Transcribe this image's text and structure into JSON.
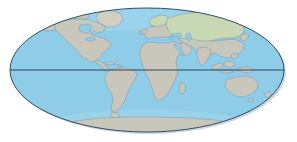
{
  "figure": {
    "title": "World map",
    "projection_label": "Mollweide (elliptical) projection",
    "background_color": "#ffffff"
  },
  "map": {
    "ocean_color": "#8fcce8",
    "ocean_shadow_color": "#7fb9d4",
    "land_color": "#c9c7bc",
    "land_vegetation_color": "#c9d8b4",
    "land_highland_color": "#d2cfc3",
    "outline_color": "#2f4f63",
    "coastline_color": "#6f8fa6",
    "graticule_color": "#1b3a4b",
    "ellipse": {
      "center_x": 147,
      "center_y": 70,
      "radius_x": 137,
      "radius_y": 62
    },
    "equator": {
      "label": "Equator",
      "y": 70,
      "visible": true
    },
    "continents": [
      {
        "name": "North America",
        "tint": "land"
      },
      {
        "name": "South America",
        "tint": "land"
      },
      {
        "name": "Greenland",
        "tint": "land"
      },
      {
        "name": "Europe",
        "tint": "land"
      },
      {
        "name": "Africa",
        "tint": "land"
      },
      {
        "name": "Asia",
        "tint": "vegetation"
      },
      {
        "name": "Australia",
        "tint": "land"
      },
      {
        "name": "Antarctica",
        "tint": "land"
      }
    ],
    "features": [
      {
        "name": "Hudson Bay"
      },
      {
        "name": "Great Lakes"
      },
      {
        "name": "Mediterranean Sea"
      },
      {
        "name": "Black Sea"
      },
      {
        "name": "Caspian Sea"
      },
      {
        "name": "Red Sea"
      },
      {
        "name": "Arabian Peninsula"
      },
      {
        "name": "Indian Subcontinent"
      },
      {
        "name": "Indonesian Archipelago"
      },
      {
        "name": "Japan"
      },
      {
        "name": "British Isles"
      },
      {
        "name": "Madagascar"
      },
      {
        "name": "New Zealand"
      },
      {
        "name": "Caribbean Islands"
      }
    ]
  }
}
